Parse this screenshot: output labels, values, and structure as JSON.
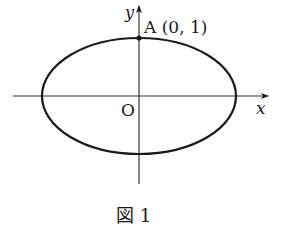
{
  "figure": {
    "caption": "図 1",
    "origin_label": "O",
    "x_axis_label": "x",
    "y_axis_label": "y",
    "point_A": {
      "label": "A (0, 1)",
      "coords": [
        0,
        1
      ]
    },
    "curve": "ellipse",
    "stroke_color": "#1a1a1a",
    "background": "#ffffff"
  }
}
